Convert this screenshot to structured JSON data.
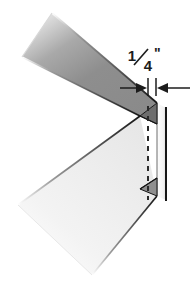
{
  "figure": {
    "background_color": "#ffffff",
    "width": 193,
    "height": 287
  },
  "annotation": {
    "dimension_label": "1/4\"",
    "fraction_numerator": "1",
    "fraction_denominator": "4",
    "unit_mark": "\"",
    "value": 0.25,
    "unit": "inch",
    "describes": "width-of-folded-edge",
    "arrow_style": "inward-pointing-pair",
    "text_color": "#1c1c1c"
  },
  "geometry": {
    "upper_flange": {
      "name": "upper-flange",
      "fill_start": "#ffffff",
      "fill_end": "#8b8b8b",
      "shading": "gradient-light-top-left-to-gray",
      "orientation": "descending-to-right"
    },
    "lower_flange": {
      "name": "lower-flange",
      "fill_start": "#f4f4f4",
      "fill_end": "#e3e3e3",
      "shading": "near-white",
      "orientation": "ascending-to-right"
    },
    "edge_face": {
      "name": "folded-edge-face",
      "fill": "#fbfbfb",
      "width_px": 10
    },
    "upper_wedge": {
      "name": "upper-corner-wedge",
      "fill": "#6e6e6e"
    },
    "lower_wedge": {
      "name": "lower-corner-wedge",
      "fill": "#8f8f8f"
    },
    "fold_line": {
      "name": "fold-line",
      "style": "dashed",
      "color": "#2a2a2a",
      "orientation": "vertical"
    },
    "outline_color": "#161616"
  }
}
